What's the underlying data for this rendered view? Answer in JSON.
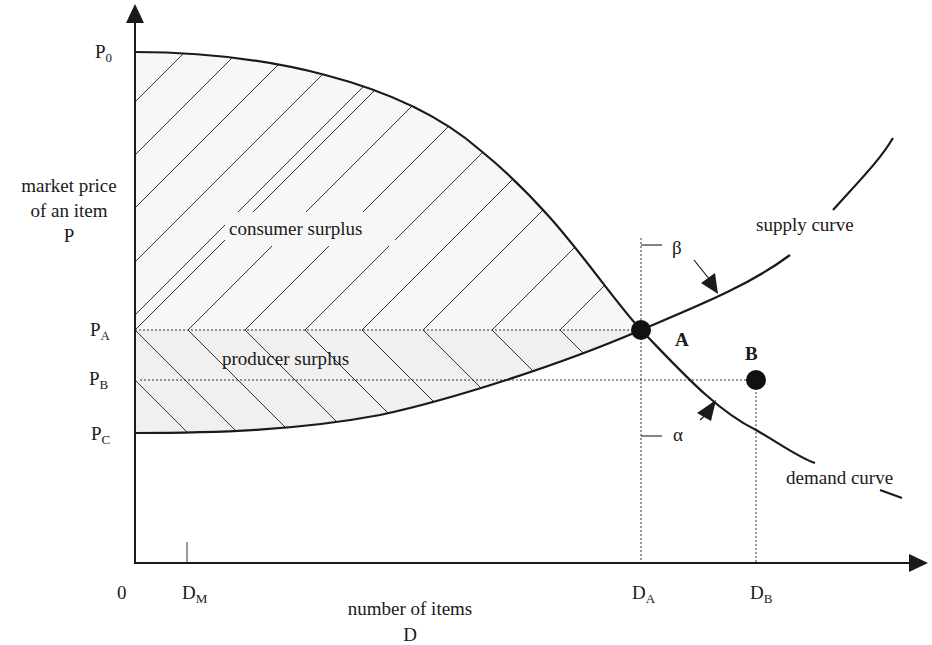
{
  "diagram": {
    "type": "economics supply-demand diagram",
    "y_axis": {
      "label_lines": [
        "market price",
        "of an item",
        "P"
      ],
      "ticks": [
        {
          "name": "P",
          "sub": "0"
        },
        {
          "name": "P",
          "sub": "A"
        },
        {
          "name": "P",
          "sub": "B"
        },
        {
          "name": "P",
          "sub": "C"
        }
      ]
    },
    "x_axis": {
      "label_lines": [
        "number of items",
        "D"
      ],
      "origin": "0",
      "ticks": [
        {
          "name": "D",
          "sub": "M"
        },
        {
          "name": "D",
          "sub": "A"
        },
        {
          "name": "D",
          "sub": "B"
        }
      ]
    },
    "regions": {
      "consumer_surplus": "consumer surplus",
      "producer_surplus": "producer surplus"
    },
    "curves": {
      "supply": "supply curve",
      "demand": "demand curve"
    },
    "points": {
      "a": "A",
      "b": "B"
    },
    "angles": {
      "beta": "β",
      "alpha": "α"
    },
    "colors": {
      "line": "#1a1a1a",
      "fill_shade": "#f0f0f0",
      "background": "#ffffff"
    }
  }
}
